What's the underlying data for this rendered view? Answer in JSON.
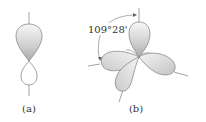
{
  "figure": {
    "panels": [
      {
        "id": "a",
        "caption": "(a)",
        "description": "single hybrid orbital with large and small lobe"
      },
      {
        "id": "b",
        "caption": "(b)",
        "description": "four tetrahedral hybrid orbitals",
        "angle_label": "109°28'"
      }
    ]
  },
  "colors": {
    "outline": "#8a8a8a",
    "lobe_dark": "#b5b5b5",
    "lobe_light": "#f4f4f4",
    "text": "#333333"
  }
}
